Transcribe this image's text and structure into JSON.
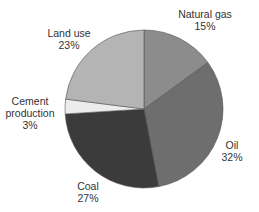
{
  "chart_data": {
    "type": "pie",
    "title": "",
    "start_angle_deg": 0,
    "direction": "clockwise",
    "slices": [
      {
        "label": "Natural gas",
        "value": 15,
        "display": "15%",
        "color": "#8c8c8c"
      },
      {
        "label": "Oil",
        "value": 32,
        "display": "32%",
        "color": "#6e6e6e"
      },
      {
        "label": "Coal",
        "value": 27,
        "display": "27%",
        "color": "#3b3b3b"
      },
      {
        "label": "Cement production",
        "value": 3,
        "display": "3%",
        "color": "#ececec"
      },
      {
        "label": "Land use",
        "value": 23,
        "display": "23%",
        "color": "#b4b4b4"
      }
    ]
  },
  "labels": [
    {
      "lines": [
        "Natural gas",
        "15%"
      ],
      "x": 205,
      "y": 8
    },
    {
      "lines": [
        "Oil",
        "32%"
      ],
      "x": 232,
      "y": 139
    },
    {
      "lines": [
        "Coal",
        "27%"
      ],
      "x": 88,
      "y": 180
    },
    {
      "lines": [
        "Cement",
        "production",
        "3%"
      ],
      "x": 30,
      "y": 95
    },
    {
      "lines": [
        "Land use",
        "23%"
      ],
      "x": 69,
      "y": 27
    }
  ]
}
